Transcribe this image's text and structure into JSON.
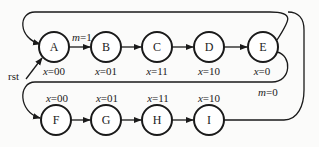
{
  "diagram": {
    "type": "state-machine",
    "reset_label": "rst",
    "states": [
      {
        "id": "A",
        "label": "A",
        "output_var": "x",
        "output_val": "=00"
      },
      {
        "id": "B",
        "label": "B",
        "output_var": "x",
        "output_val": "=01"
      },
      {
        "id": "C",
        "label": "C",
        "output_var": "x",
        "output_val": "=11"
      },
      {
        "id": "D",
        "label": "D",
        "output_var": "x",
        "output_val": "=10"
      },
      {
        "id": "E",
        "label": "E",
        "output_var": "x",
        "output_val": "=0"
      },
      {
        "id": "F",
        "label": "F",
        "output_var": "x",
        "output_val": "=00"
      },
      {
        "id": "G",
        "label": "G",
        "output_var": "x",
        "output_val": "=01"
      },
      {
        "id": "H",
        "label": "H",
        "output_var": "x",
        "output_val": "=11"
      },
      {
        "id": "I",
        "label": "I",
        "output_var": "x",
        "output_val": "=10"
      }
    ],
    "transitions": [
      {
        "from": "A",
        "to": "B",
        "cond_var": "m",
        "cond_val": "=1"
      },
      {
        "from": "B",
        "to": "C"
      },
      {
        "from": "C",
        "to": "D"
      },
      {
        "from": "D",
        "to": "E"
      },
      {
        "from": "E",
        "to": "A"
      },
      {
        "from": "E",
        "to": "F",
        "cond_var": "m",
        "cond_val": "=0"
      },
      {
        "from": "F",
        "to": "G"
      },
      {
        "from": "G",
        "to": "H"
      },
      {
        "from": "H",
        "to": "I"
      },
      {
        "from": "I",
        "to": "A"
      }
    ]
  }
}
